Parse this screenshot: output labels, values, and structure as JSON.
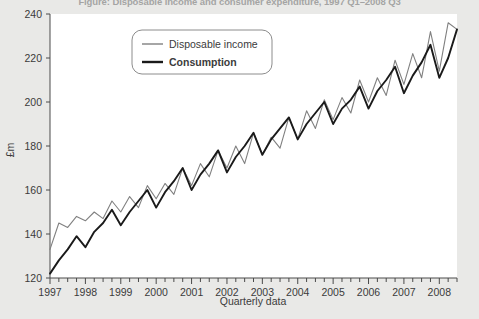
{
  "figure": {
    "title_partial": "Figure: Disposable income and consumer expenditure, 1997 Q1–2008 Q3",
    "background_color": "#e9e9e7",
    "plot_background_color": "#ffffff"
  },
  "legend": {
    "position": "top-left-inside",
    "entries": [
      {
        "label": "Disposable income",
        "color": "#808080",
        "bold": false,
        "width": 1.1
      },
      {
        "label": "Consumption",
        "color": "#1a1a1a",
        "bold": true,
        "width": 2.0
      }
    ]
  },
  "axes": {
    "y_label": "£m",
    "x_label": "Quarterly data",
    "y_ticks": [
      "120",
      "140",
      "160",
      "180",
      "200",
      "220",
      "240"
    ],
    "x_ticks": [
      "1997",
      "1998",
      "1999",
      "2000",
      "2001",
      "2002",
      "2003",
      "2004",
      "2005",
      "2006",
      "2007",
      "2008"
    ]
  },
  "chart_data": {
    "type": "line",
    "title": "Disposable income and consumer expenditure, 1997 Q1–2008 Q3",
    "xlabel": "Quarterly data",
    "ylabel": "£m",
    "ylim": [
      120,
      240
    ],
    "yticks": [
      120,
      140,
      160,
      180,
      200,
      220,
      240
    ],
    "xlim": [
      "1997 Q1",
      "2008 Q3"
    ],
    "xticks": [
      1997,
      1998,
      1999,
      2000,
      2001,
      2002,
      2003,
      2004,
      2005,
      2006,
      2007,
      2008
    ],
    "grid": false,
    "legend_position": "upper left",
    "x": [
      "1997 Q1",
      "1997 Q2",
      "1997 Q3",
      "1997 Q4",
      "1998 Q1",
      "1998 Q2",
      "1998 Q3",
      "1998 Q4",
      "1999 Q1",
      "1999 Q2",
      "1999 Q3",
      "1999 Q4",
      "2000 Q1",
      "2000 Q2",
      "2000 Q3",
      "2000 Q4",
      "2001 Q1",
      "2001 Q2",
      "2001 Q3",
      "2001 Q4",
      "2002 Q1",
      "2002 Q2",
      "2002 Q3",
      "2002 Q4",
      "2003 Q1",
      "2003 Q2",
      "2003 Q3",
      "2003 Q4",
      "2004 Q1",
      "2004 Q2",
      "2004 Q3",
      "2004 Q4",
      "2005 Q1",
      "2005 Q2",
      "2005 Q3",
      "2005 Q4",
      "2006 Q1",
      "2006 Q2",
      "2006 Q3",
      "2006 Q4",
      "2007 Q1",
      "2007 Q2",
      "2007 Q3",
      "2007 Q4",
      "2008 Q1",
      "2008 Q2",
      "2008 Q3"
    ],
    "series": [
      {
        "name": "Disposable income",
        "color": "#808080",
        "values": [
          133,
          145,
          143,
          148,
          146,
          150,
          147,
          155,
          150,
          157,
          152,
          162,
          156,
          163,
          158,
          170,
          162,
          172,
          166,
          178,
          170,
          180,
          172,
          186,
          176,
          184,
          179,
          193,
          183,
          196,
          188,
          201,
          192,
          202,
          195,
          210,
          200,
          211,
          203,
          219,
          208,
          222,
          211,
          232,
          214,
          236,
          233
        ]
      },
      {
        "name": "Consumption",
        "color": "#1a1a1a",
        "values": [
          122,
          128,
          133,
          139,
          134,
          141,
          145,
          151,
          144,
          150,
          155,
          160,
          152,
          159,
          164,
          170,
          160,
          167,
          172,
          178,
          168,
          175,
          180,
          186,
          176,
          183,
          188,
          193,
          183,
          190,
          195,
          200,
          190,
          197,
          201,
          207,
          197,
          205,
          210,
          216,
          204,
          212,
          218,
          226,
          211,
          220,
          233
        ]
      }
    ]
  }
}
